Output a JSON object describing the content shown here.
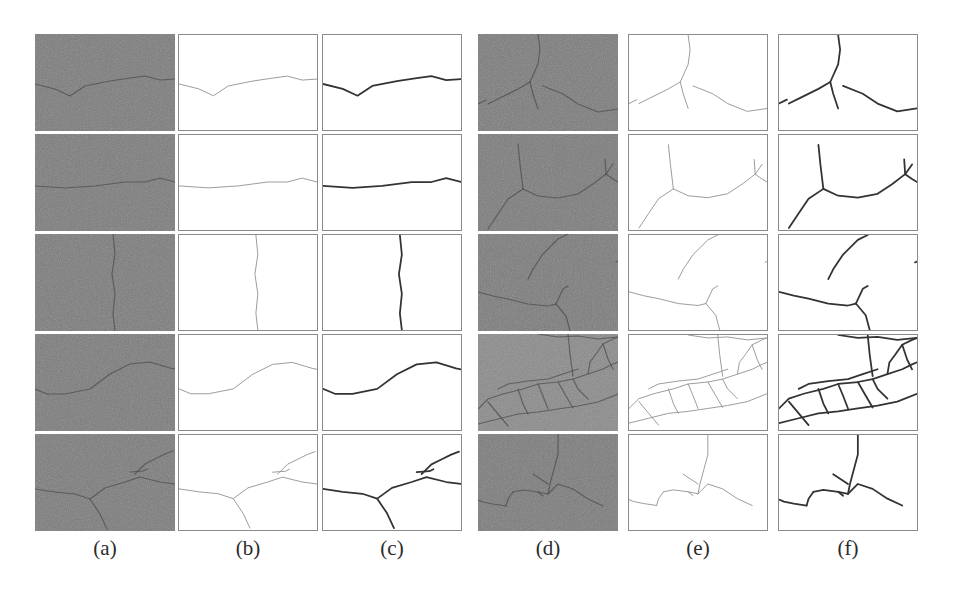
{
  "figure": {
    "column_labels": [
      "(a)",
      "(b)",
      "(c)",
      "(d)",
      "(e)",
      "(f)"
    ],
    "columns": [
      {
        "key": "a",
        "type": "photo",
        "x": 35
      },
      {
        "key": "b",
        "type": "mask-thin",
        "x": 178
      },
      {
        "key": "c",
        "type": "mask-bold",
        "x": 322
      },
      {
        "key": "d",
        "type": "photo",
        "x": 478
      },
      {
        "key": "e",
        "type": "mask-thin",
        "x": 628
      },
      {
        "key": "f",
        "type": "mask-bold",
        "x": 778
      }
    ],
    "row_y": [
      34,
      134,
      234,
      334,
      434
    ],
    "colors": {
      "photo_bg": "#7b7b7b",
      "photo_crack": "#4a4a4a",
      "thin_crack": "#9a9a9a",
      "bold_crack": "#333333",
      "border": "#8a8a8a"
    },
    "left_group_cracks": [
      [
        [
          "0,50 20,55 35,62 50,52 75,47 95,44 110,42 125,46 140,45"
        ]
      ],
      [
        [
          "0,52 30,54 60,52 90,48 110,48 125,44 140,48"
        ]
      ],
      [
        [
          "78,0 80,20 77,40 80,60 78,80 80,97"
        ]
      ],
      [
        [
          "0,55 12,60 30,60 55,55 75,40 95,30 115,28 135,34 140,35"
        ]
      ],
      [
        [
          "0,55 20,58 40,60 55,65 70,54 90,48 105,43 125,48 140,50",
          "55,65 65,80 72,95",
          "95,38 108,37 112,35",
          "100,40 110,30 120,25 130,20 138,17"
        ]
      ]
    ],
    "right_group_cracks": [
      [
        [
          "60,0 62,15 60,30 52,48",
          "52,48 40,55 20,65 10,70",
          "0,70 8,66",
          "52,48 55,60 60,75",
          "65,52 85,60 100,70 120,78 140,75"
        ]
      ],
      [
        [
          "40,10 42,30 45,55",
          "45,55 30,65 20,80 10,95",
          "45,55 60,62 80,64 100,60 115,50 128,40 135,30",
          "128,40 135,45 140,48",
          "128,40 127,25"
        ]
      ],
      [
        [
          "0,58 15,62 30,65 50,70 70,72 78,70",
          "78,70 85,55 90,52",
          "78,70 88,82 92,97",
          "50,45 55,35 65,20 80,5 90,0",
          "138,28 140,27"
        ]
      ],
      [
        [
          "0,75 10,65 25,60 45,55 60,50 80,48 95,45 110,40 125,35 135,30 140,28",
          "0,90 20,85 40,80 60,78 80,75 100,72 120,68 140,60",
          "10,68 20,80 30,92",
          "40,55 45,70 50,80",
          "60,50 65,62 70,75",
          "80,48 88,62 95,74",
          "95,45 100,55 110,65",
          "110,40 112,28 118,20 125,10 135,5 140,3",
          "90,0 92,20 95,42",
          "125,10 130,25 135,35",
          "60,0 80,3 100,2 120,5 140,3",
          "20,55 30,50 50,47 70,45 85,40 100,35"
        ]
      ],
      [
        [
          "80,0 80,20 76,35 72,50 70,60",
          "70,60 60,58 45,56 35,58",
          "35,58 30,65 28,72",
          "28,72 15,70 5,68 0,66",
          "70,60 80,50 95,55 110,65 125,72",
          "60,58 65,62",
          "55,40 70,50"
        ]
      ]
    ]
  }
}
